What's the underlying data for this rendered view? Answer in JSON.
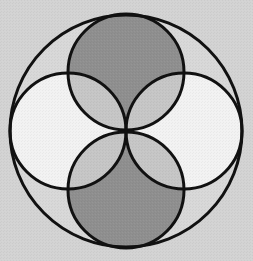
{
  "diagram": {
    "type": "geometric-circles",
    "width": 253,
    "height": 261,
    "colors": {
      "background": "#d3d3d3",
      "outer_fill": "#d8d8d8",
      "vertical_circles_fill": "#8f8f8f",
      "horizontal_circles_fill": "#f2f2f2",
      "lens_overlap_fill": "#c6c6c6",
      "stroke": "#111111"
    },
    "stroke_width": 3,
    "outer_circle": {
      "cx": 126,
      "cy": 131,
      "r": 116
    },
    "inner_circles": [
      {
        "id": "top",
        "cx": 126,
        "cy": 72,
        "r": 58,
        "shade": "dark"
      },
      {
        "id": "bottom",
        "cx": 126,
        "cy": 190,
        "r": 58,
        "shade": "dark"
      },
      {
        "id": "left",
        "cx": 68,
        "cy": 131,
        "r": 58,
        "shade": "light"
      },
      {
        "id": "right",
        "cx": 184,
        "cy": 131,
        "r": 58,
        "shade": "light"
      }
    ]
  }
}
